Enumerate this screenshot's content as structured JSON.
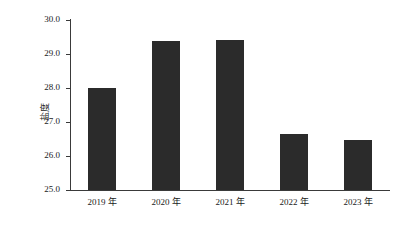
{
  "chart_data": {
    "type": "bar",
    "title": "",
    "subtitle": "",
    "xlabel": "",
    "ylabel": "盐度",
    "categories": [
      "2019 年",
      "2020 年",
      "2021 年",
      "2022 年",
      "2023 年"
    ],
    "values": [
      28.0,
      29.37,
      29.4,
      26.65,
      26.47
    ],
    "series": [
      {
        "name": "盐度",
        "values": [
          28.0,
          29.37,
          29.4,
          26.65,
          26.47
        ]
      }
    ],
    "ylim": [
      25.0,
      30.0
    ],
    "ytick_labels": [
      "30.0",
      "29.0",
      "28.0",
      "27.0",
      "26.0",
      "25.0"
    ],
    "ytick_values": [
      30.0,
      29.0,
      28.0,
      27.0,
      26.0,
      25.0
    ],
    "grid": false,
    "legend": false,
    "legend_position": "none",
    "bar_color": "#2b2b2b",
    "axis_color": "#3a3a3a",
    "background_color": "#ffffff"
  }
}
